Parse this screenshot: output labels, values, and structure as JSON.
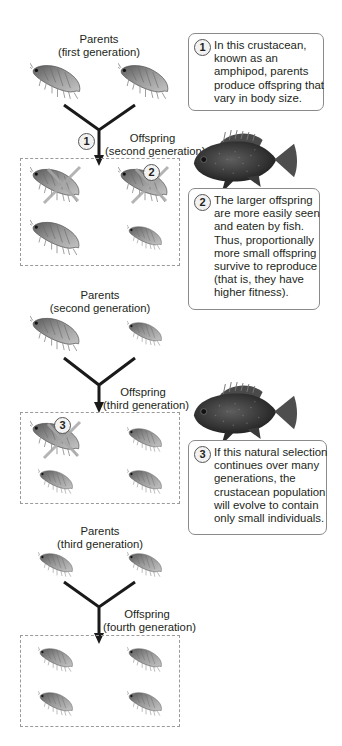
{
  "colors": {
    "text": "#231f20",
    "connector": "#1a1a1a",
    "callout_border": "#8a8a8a",
    "dashed_border": "#9a9a9a",
    "amphipod_body": "#8c8c8c",
    "amphipod_dark": "#4a4a4a",
    "x_mark": "#a8a8a8",
    "fish_body": "#3a3a3a"
  },
  "generations": [
    {
      "parents_label": {
        "line1": "Parents",
        "line2": "(first generation)"
      },
      "offspring_label": {
        "line1": "Offspring",
        "line2": "(second generation)"
      },
      "step_marker": "1"
    },
    {
      "parents_label": {
        "line1": "Parents",
        "line2": "(second generation)"
      },
      "offspring_label": {
        "line1": "Offspring",
        "line2": "(third generation)"
      }
    },
    {
      "parents_label": {
        "line1": "Parents",
        "line2": "(third generation)"
      },
      "offspring_label": {
        "line1": "Offspring",
        "line2": "(fourth generation)"
      }
    }
  ],
  "markers": {
    "eaten_marker_2": "2",
    "eaten_marker_3": "3"
  },
  "callouts": [
    {
      "number": "1",
      "lines": [
        "In this crustacean,",
        "known as an",
        "amphipod, parents",
        "produce offspring that",
        "vary in body size."
      ]
    },
    {
      "number": "2",
      "lines": [
        "The larger offspring",
        "are more easily seen",
        "and eaten by fish.",
        "Thus, proportionally",
        "more small offspring",
        "survive to reproduce",
        "(that is, they have",
        "higher fitness)."
      ]
    },
    {
      "number": "3",
      "lines": [
        "If this natural selection",
        "continues over many",
        "generations, the",
        "crustacean population",
        "will evolve to contain",
        "only small individuals."
      ]
    }
  ],
  "icons": {
    "organism": "amphipod-icon",
    "predator": "fish-icon",
    "eaten": "x-mark-icon"
  }
}
